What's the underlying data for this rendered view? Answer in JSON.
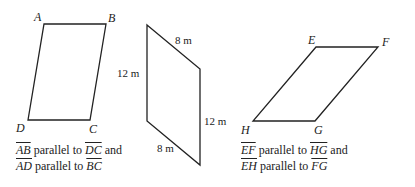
{
  "figures": [
    {
      "vertices": [
        "A",
        "B",
        "C",
        "D"
      ],
      "caption": {
        "line1": {
          "seg1": "AB",
          "mid": " parallel to ",
          "seg2": "DC",
          "end": " and"
        },
        "line2": {
          "seg1": "AD",
          "mid": " parallel to ",
          "seg2": "BC",
          "end": ""
        }
      }
    },
    {
      "measurements": {
        "top": "8 m",
        "left": "12 m",
        "right": "12 m",
        "bottom": "8 m"
      }
    },
    {
      "vertices": [
        "E",
        "F",
        "G",
        "H"
      ],
      "caption": {
        "line1": {
          "seg1": "EF",
          "mid": " parallel to ",
          "seg2": "HG",
          "end": " and"
        },
        "line2": {
          "seg1": "EH",
          "mid": " parallel to ",
          "seg2": "FG",
          "end": ""
        }
      }
    }
  ],
  "colors": {
    "stroke": "#222222",
    "background": "#ffffff"
  }
}
